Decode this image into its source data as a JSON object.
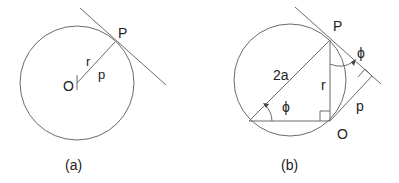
{
  "figure_a": {
    "caption": "(a)",
    "labels": {
      "point_p": "P",
      "point_o": "O",
      "radius": "r",
      "perp": "p"
    }
  },
  "figure_b": {
    "caption": "(b)",
    "labels": {
      "point_p": "P",
      "point_o": "O",
      "diameter": "2a",
      "radius": "r",
      "perp": "p",
      "angle1": "ϕ",
      "angle2": "ϕ"
    }
  },
  "colors": {
    "stroke": "#6a6a6a",
    "text": "#222222"
  }
}
